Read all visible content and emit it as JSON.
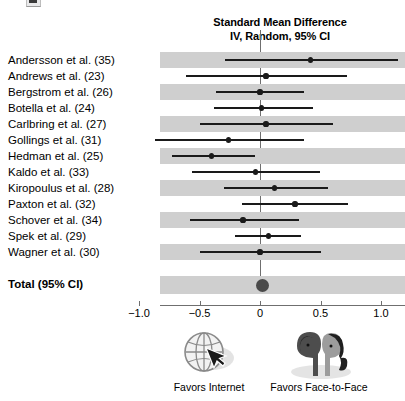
{
  "header": {
    "title_line1": "Standard Mean Difference",
    "title_line2": "IV, Random, 95% CI"
  },
  "total": {
    "label": "Total (95% CI)"
  },
  "footer": {
    "left_caption": "Favors Internet",
    "right_caption": "Favors Face-to-Face",
    "left_icon": "globe-cursor-icon",
    "right_icon": "two-faces-icon"
  },
  "chart_data": {
    "type": "forest",
    "title": "Standard Mean Difference\nIV, Random, 95% CI",
    "xlabel": "Standard Mean Difference",
    "ylabel": "",
    "xlim": [
      -1.2,
      1.2
    ],
    "grid": false,
    "null_line": 0,
    "tick_values": [
      -1.0,
      -0.5,
      0,
      0.5,
      1.0
    ],
    "tick_labels": [
      "−1.0",
      "−0.5",
      "0",
      "0.5",
      "1.0"
    ],
    "left_direction_label": "Favors Internet",
    "right_direction_label": "Favors Face-to-Face",
    "categories": [
      "Andersson et al. (35)",
      "Andrews et al. (23)",
      "Bergstrom et al. (26)",
      "Botella et al. (24)",
      "Carlbring et al. (27)",
      "Gollings et al. (31)",
      "Hedman et al. (25)",
      "Kaldo et al. (33)",
      "Kiropoulus et al. (28)",
      "Paxton et al. (32)",
      "Schover et al. (34)",
      "Spek et al. (29)",
      "Wagner et al. (30)"
    ],
    "studies": [
      {
        "label": "Andersson et al. (35)",
        "estimate": 0.42,
        "ci_low": -0.29,
        "ci_high": 1.14
      },
      {
        "label": "Andrews et al. (23)",
        "estimate": 0.05,
        "ci_low": -0.61,
        "ci_high": 0.72
      },
      {
        "label": "Bergstrom et al. (26)",
        "estimate": 0.0,
        "ci_low": -0.36,
        "ci_high": 0.36
      },
      {
        "label": "Botella et al. (24)",
        "estimate": 0.01,
        "ci_low": -0.38,
        "ci_high": 0.44
      },
      {
        "label": "Carlbring et al. (27)",
        "estimate": 0.05,
        "ci_low": -0.5,
        "ci_high": 0.6
      },
      {
        "label": "Gollings et al. (31)",
        "estimate": -0.26,
        "ci_low": -0.87,
        "ci_high": 0.36
      },
      {
        "label": "Hedman et al. (25)",
        "estimate": -0.4,
        "ci_low": -0.73,
        "ci_high": -0.04
      },
      {
        "label": "Kaldo et al. (33)",
        "estimate": -0.04,
        "ci_low": -0.56,
        "ci_high": 0.5
      },
      {
        "label": "Kiropoulus et al. (28)",
        "estimate": 0.12,
        "ci_low": -0.3,
        "ci_high": 0.56
      },
      {
        "label": "Paxton et al. (32)",
        "estimate": 0.29,
        "ci_low": -0.15,
        "ci_high": 0.73
      },
      {
        "label": "Schover et al. (34)",
        "estimate": -0.14,
        "ci_low": -0.58,
        "ci_high": 0.32
      },
      {
        "label": "Spek et al. (29)",
        "estimate": 0.07,
        "ci_low": -0.21,
        "ci_high": 0.34
      },
      {
        "label": "Wagner et al. (30)",
        "estimate": 0.0,
        "ci_low": -0.5,
        "ci_high": 0.5
      }
    ],
    "summary": {
      "label": "Total (95% CI)",
      "estimate": 0.02,
      "ci_low": -0.04,
      "ci_high": 0.08
    }
  }
}
